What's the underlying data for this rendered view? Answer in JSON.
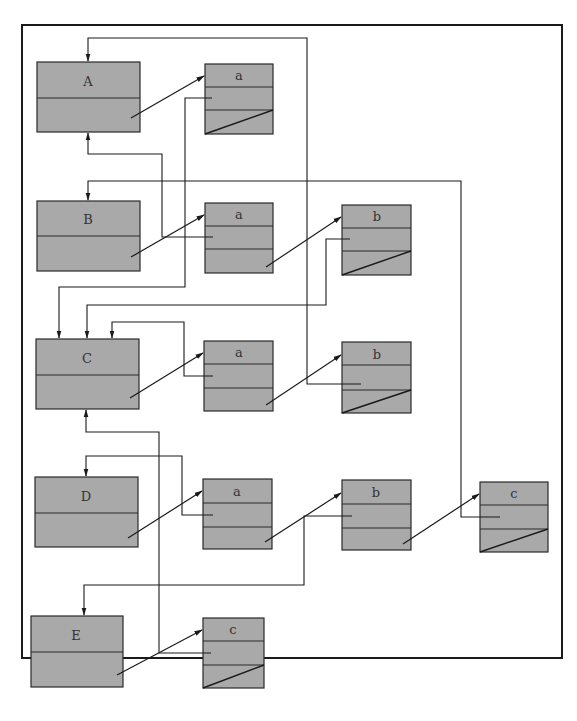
{
  "diagram": {
    "type": "linked-list-structure",
    "colors": {
      "fill": "#a9a9a9",
      "stroke": "#2a2a2a",
      "background": "#ffffff",
      "frame": "#1a1a1a"
    },
    "headers": [
      {
        "id": "A",
        "label": "A"
      },
      {
        "id": "B",
        "label": "B"
      },
      {
        "id": "C",
        "label": "C"
      },
      {
        "id": "D",
        "label": "D"
      },
      {
        "id": "E",
        "label": "E"
      }
    ],
    "nodes": [
      {
        "row": "A",
        "label": "a",
        "terminal": true
      },
      {
        "row": "B",
        "label": "a",
        "terminal": false
      },
      {
        "row": "B",
        "label": "b",
        "terminal": true
      },
      {
        "row": "C",
        "label": "a",
        "terminal": false
      },
      {
        "row": "C",
        "label": "b",
        "terminal": true
      },
      {
        "row": "D",
        "label": "a",
        "terminal": false
      },
      {
        "row": "D",
        "label": "b",
        "terminal": false
      },
      {
        "row": "D",
        "label": "c",
        "terminal": true
      },
      {
        "row": "E",
        "label": "c",
        "terminal": true
      }
    ]
  }
}
